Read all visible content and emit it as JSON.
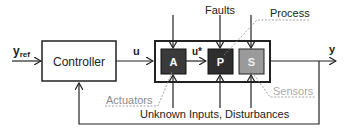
{
  "diagram": {
    "input_label": "y",
    "input_subscript": "ref",
    "controller_label": "Controller",
    "control_signal": "u",
    "actuated_signal": "u*",
    "output_label": "y",
    "faults_label": "Faults",
    "process_label": "Process",
    "actuators_label": "Actuators",
    "sensors_label": "Sensors",
    "disturbances_label": "Unknown Inputs, Disturbances",
    "blocks": [
      {
        "id": "A",
        "label": "A",
        "name": "actuator",
        "color": "#3a3a3a"
      },
      {
        "id": "P",
        "label": "P",
        "name": "process",
        "color": "#2e2e2e"
      },
      {
        "id": "S",
        "label": "S",
        "name": "sensor",
        "color": "#9a9a9a"
      }
    ],
    "colors": {
      "line": "#222222",
      "annotation": "#8a8a8a"
    }
  }
}
